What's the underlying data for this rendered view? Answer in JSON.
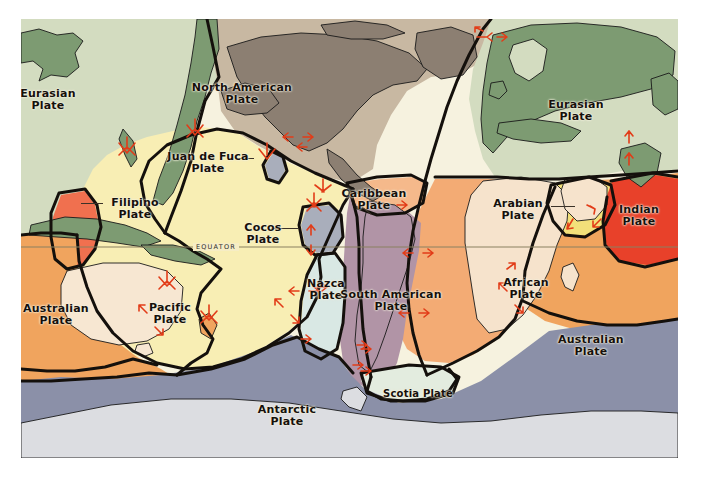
{
  "figure": {
    "type": "tectonic-plate-map",
    "background": "#ffffff",
    "frame": {
      "x": 21,
      "y": 19,
      "width": 657,
      "height": 439
    }
  },
  "equator": {
    "label": "EQUATOR",
    "line_color": "#8a8060",
    "y": 247
  },
  "legend_colors": {
    "pacific_ocean": "#f8eeb4",
    "pacific_land": "#f3e6a6",
    "north_american_ocean": "#c8b8a2",
    "north_american_land": "#8c7f72",
    "eurasian_ocean": "#d3dcc0",
    "eurasian_land": "#7d9b72",
    "african_ocean": "#f3ab74",
    "african_land": "#f6e3cc",
    "australian_ocean": "#f0a45e",
    "australian_land": "#f7e7d2",
    "antarctic_ocean": "#8b90a8",
    "antarctic_land": "#dcdde1",
    "south_american": "#b194a6",
    "nazca": "#d9e8e4",
    "cocos": "#a9aebb",
    "caribbean": "#f5b98b",
    "scotia": "#e3ecdf",
    "arabian": "#f2e07a",
    "indian": "#e8412a",
    "filipino": "#f0704f",
    "juan_de_fuca": "#a9aebb",
    "boundary_line": "#14100c",
    "arrow": "#e23c18",
    "label_text": "#16100c"
  },
  "plates": [
    {
      "id": "eurasian-west",
      "name": "Eurasian\nPlate",
      "x": 10,
      "y": 88,
      "size": "s11"
    },
    {
      "id": "eurasian-east",
      "name": "Eurasian\nPlate",
      "x": 538,
      "y": 99,
      "size": "s11"
    },
    {
      "id": "north-american",
      "name": "North American\nPlate",
      "x": 200,
      "y": 82,
      "size": "s11"
    },
    {
      "id": "juan-de-fuca",
      "name": "Juan de Fuca\nPlate",
      "x": 182,
      "y": 151,
      "size": "s11"
    },
    {
      "id": "filipino",
      "name": "Filipino\nPlate",
      "x": 100,
      "y": 197,
      "size": "s11"
    },
    {
      "id": "cocos",
      "name": "Cocos\nPlate",
      "x": 245,
      "y": 222,
      "size": "s11"
    },
    {
      "id": "caribbean",
      "name": "Caribbean\nPlate",
      "x": 355,
      "y": 188,
      "size": "s11"
    },
    {
      "id": "arabian",
      "name": "Arabian\nPlate",
      "x": 518,
      "y": 198,
      "size": "s11"
    },
    {
      "id": "indian",
      "name": "Indian\nPlate",
      "x": 626,
      "y": 204,
      "size": "s11"
    },
    {
      "id": "pacific",
      "name": "Pacific\nPlate",
      "x": 148,
      "y": 302,
      "size": "s11"
    },
    {
      "id": "nazca",
      "name": "Nazca\nPlate",
      "x": 306,
      "y": 278,
      "size": "s11"
    },
    {
      "id": "south-american",
      "name": "South American\nPlate",
      "x": 370,
      "y": 289,
      "size": "s11"
    },
    {
      "id": "african",
      "name": "African\nPlate",
      "x": 505,
      "y": 277,
      "size": "s11"
    },
    {
      "id": "australian-west",
      "name": "Australian\nPlate",
      "x": 29,
      "y": 303,
      "size": "s11"
    },
    {
      "id": "australian-east",
      "name": "Australian\nPlate",
      "x": 570,
      "y": 334,
      "size": "s11"
    },
    {
      "id": "scotia",
      "name": "Scotia Plate",
      "x": 396,
      "y": 375,
      "size": "s10"
    },
    {
      "id": "antarctic",
      "name": "Antarctic\nPlate",
      "x": 262,
      "y": 404,
      "size": "s11"
    }
  ],
  "leaders": [
    {
      "id": "leader-filipino",
      "x": 81,
      "y": 203,
      "w": 22
    },
    {
      "id": "leader-cocos",
      "x": 271,
      "y": 228,
      "w": 26
    },
    {
      "id": "leader-caribbean",
      "x": 360,
      "y": 205,
      "w": 14
    },
    {
      "id": "leader-arabian",
      "x": 551,
      "y": 206,
      "w": 22
    },
    {
      "id": "leader-juandefuca",
      "x": 238,
      "y": 158,
      "w": 16
    }
  ]
}
